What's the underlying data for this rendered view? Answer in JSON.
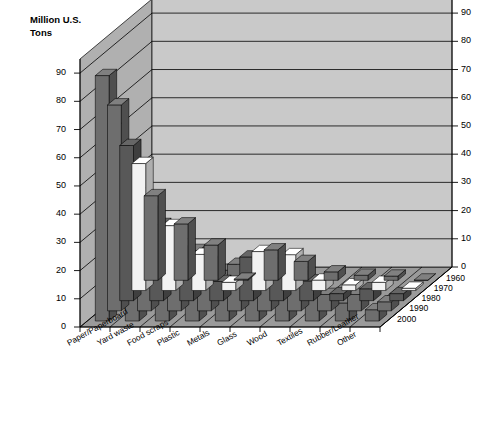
{
  "chart_data": {
    "type": "bar",
    "title": "Changes in Composition of Municipal Solid Waste",
    "ylabel": "Million U.S. Tons",
    "xlabel": "",
    "zlabel": "",
    "ylim": [
      0,
      95
    ],
    "yticks": [
      0,
      10,
      20,
      30,
      40,
      50,
      60,
      70,
      80,
      90
    ],
    "ytick_labels": [
      "0",
      "10",
      "20",
      "30",
      "40",
      "50",
      "60",
      "70",
      "80",
      "90"
    ],
    "grid": true,
    "projection": "3d",
    "legend": "none",
    "categories": [
      "Paper/Paperboard",
      "Yard waste",
      "Food scraps",
      "Plastic",
      "Metals",
      "Glass",
      "Wood",
      "Textiles",
      "Rubber/Leather",
      "Other"
    ],
    "depth_axis_labels": [
      "2000",
      "1990",
      "1980",
      "1970",
      "1960"
    ],
    "series": [
      {
        "name": "1960",
        "values": [
          30,
          20,
          12.5,
          0.4,
          10.8,
          6.7,
          3.0,
          1.8,
          1.5,
          0.1
        ]
      },
      {
        "name": "1970",
        "values": [
          45,
          23,
          12.8,
          2.9,
          13.8,
          12.7,
          3.7,
          2.0,
          2.9,
          0.8
        ]
      },
      {
        "name": "1980",
        "values": [
          55,
          27,
          13.0,
          6.8,
          15.5,
          15.1,
          7.0,
          2.5,
          4.2,
          2.5
        ]
      },
      {
        "name": "1990",
        "values": [
          73,
          35,
          20.8,
          17.1,
          16.5,
          13.1,
          12.2,
          5.8,
          5.8,
          3.2
        ]
      },
      {
        "name": "2000",
        "values": [
          87,
          27.7,
          26.2,
          25.0,
          18.0,
          12.8,
          13.0,
          9.4,
          6.4,
          4.0
        ]
      }
    ],
    "bar_colors": {
      "1960": "#6e6e6e",
      "1970": "#f2f2f2",
      "1980": "#585858",
      "1990": "#6e6e6e",
      "2000": "#6e6e6e"
    },
    "wall_color": "#b0b0b0",
    "back_wall_color": "#c9c9c9",
    "floor_color": "#9a9a9a",
    "gridline_color": "#000000"
  },
  "caption": ""
}
